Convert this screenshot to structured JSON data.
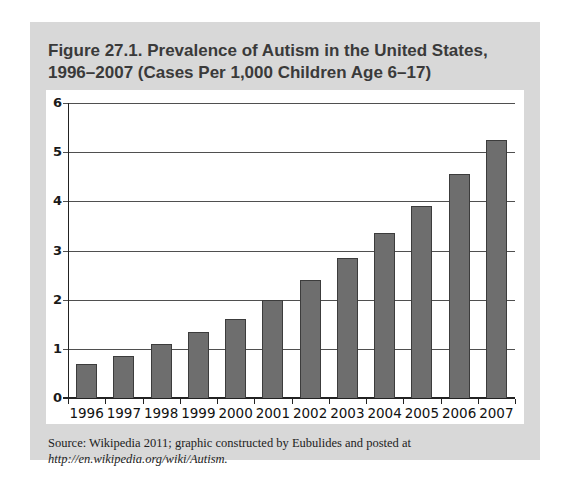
{
  "panel": {
    "background_color": "#d8d8d8"
  },
  "figure_title": "Figure 27.1. Prevalence of Autism in the United States, 1996–2007 (Cases Per 1,000 Children Age 6–17)",
  "source": {
    "prefix": "Source: Wikipedia 2011; graphic constructed by Eubulides and posted at ",
    "link_text": "http://en.wikipedia.org/wiki/Autism."
  },
  "chart_data": {
    "type": "bar",
    "title": "Figure 27.1. Prevalence of Autism in the United States, 1996–2007 (Cases Per 1,000 Children Age 6–17)",
    "categories": [
      "1996",
      "1997",
      "1998",
      "1999",
      "2000",
      "2001",
      "2002",
      "2003",
      "2004",
      "2005",
      "2006",
      "2007"
    ],
    "values": [
      0.7,
      0.85,
      1.1,
      1.35,
      1.6,
      2.0,
      2.4,
      2.85,
      3.35,
      3.9,
      4.55,
      5.25
    ],
    "xlabel": "",
    "ylabel": "",
    "ylim": [
      0,
      6
    ],
    "yticks": [
      0,
      1,
      2,
      3,
      4,
      5,
      6
    ],
    "grid": true,
    "legend": "none",
    "bar_color": "#6e6e6e",
    "bar_border_color": "#3c3c3c",
    "gridline_color": "#4f4f4f",
    "axis_color": "#222222"
  }
}
